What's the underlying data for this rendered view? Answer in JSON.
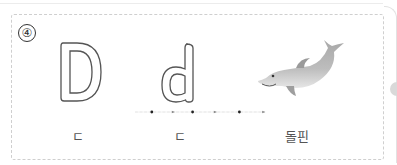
{
  "exercise": {
    "number": "④",
    "items": [
      {
        "glyph": "D",
        "label": "ㄷ"
      },
      {
        "glyph": "d",
        "label": "ㄷ"
      },
      {
        "glyph": "dolphin",
        "label": "돌핀"
      }
    ]
  },
  "colors": {
    "outline": "#555555",
    "dash": "#cfcfcf",
    "dot": "#222222",
    "arrow": "#888888"
  }
}
